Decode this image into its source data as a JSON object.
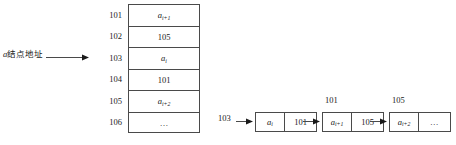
{
  "diagram": {
    "pointer": {
      "label": "a结点地址",
      "target_address": "103"
    },
    "memory_table": {
      "addresses": [
        "101",
        "102",
        "103",
        "104",
        "105",
        "106"
      ],
      "cells": [
        {
          "text": "a",
          "subscript": "i+1",
          "italic": true
        },
        {
          "text": "105",
          "subscript": "",
          "italic": false
        },
        {
          "text": "a",
          "subscript": "i",
          "italic": true
        },
        {
          "text": "101",
          "subscript": "",
          "italic": false
        },
        {
          "text": "a",
          "subscript": "i+2",
          "italic": true
        },
        {
          "text": "…",
          "subscript": "",
          "italic": false
        }
      ]
    },
    "linked_list": {
      "head_label": "103",
      "nodes": [
        {
          "address_label": "",
          "data": "a",
          "data_subscript": "i",
          "data_italic": true,
          "link": "101"
        },
        {
          "address_label": "101",
          "data": "a",
          "data_subscript": "i+1",
          "data_italic": true,
          "link": "105"
        },
        {
          "address_label": "105",
          "data": "a",
          "data_subscript": "i+2",
          "data_italic": true,
          "link": "…"
        }
      ]
    },
    "colors": {
      "line": "#4a4a4a",
      "text": "#1a1a1a",
      "background": "#ffffff"
    }
  }
}
